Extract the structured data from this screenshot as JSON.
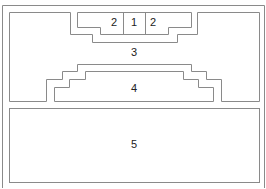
{
  "diagram": {
    "regions": [
      {
        "id": "region-1",
        "label": "1"
      },
      {
        "id": "region-2-left",
        "label": "2"
      },
      {
        "id": "region-2-right",
        "label": "2"
      },
      {
        "id": "region-3",
        "label": "3"
      },
      {
        "id": "region-4",
        "label": "4"
      },
      {
        "id": "region-5",
        "label": "5"
      }
    ],
    "line_color": "#8a8a8a"
  }
}
